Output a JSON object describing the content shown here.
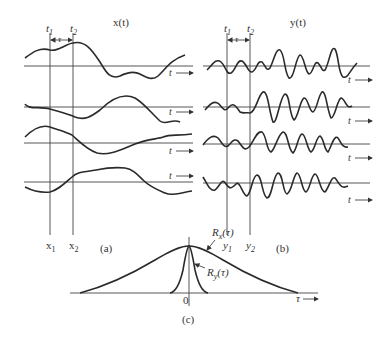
{
  "figure": {
    "panel_a": {
      "title": "x(t)",
      "time_labels": {
        "t1": "t",
        "t1_sub": "1",
        "t2": "t",
        "t2_sub": "2"
      },
      "tau_label": "τ",
      "axis_label": "t",
      "sample_labels": {
        "x1": "x",
        "x1_sub": "1",
        "x2": "x",
        "x2_sub": "2"
      },
      "caption": "(a)",
      "num_realizations": 4
    },
    "panel_b": {
      "title": "y(t)",
      "time_labels": {
        "t1": "t",
        "t1_sub": "1",
        "t2": "t",
        "t2_sub": "2"
      },
      "tau_label": "τ",
      "axis_label": "t",
      "sample_labels": {
        "y1": "y",
        "y1_sub": "1",
        "y2": "y",
        "y2_sub": "2"
      },
      "caption": "(b)",
      "num_realizations": 4
    },
    "panel_c": {
      "curve_x_label": "R",
      "curve_x_sub": "x",
      "curve_x_arg": "(τ)",
      "curve_y_label": "R",
      "curve_y_sub": "y",
      "curve_y_arg": "(τ)",
      "origin_label": "0",
      "axis_label": "τ",
      "caption": "(c)"
    }
  },
  "colors": {
    "stroke": "#2a2a2a",
    "background": "#ffffff"
  }
}
